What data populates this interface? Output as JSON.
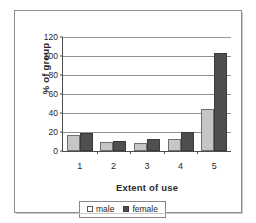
{
  "chart_data": {
    "type": "bar",
    "title": "",
    "subtitle": "",
    "xlabel": "Extent of use",
    "ylabel": "% of group",
    "categories": [
      "1",
      "2",
      "3",
      "4",
      "5"
    ],
    "series": [
      {
        "name": "male",
        "values": [
          17,
          9,
          8,
          13,
          44
        ],
        "color": "#c6c6c6"
      },
      {
        "name": "female",
        "values": [
          19,
          11,
          13,
          20,
          103
        ],
        "color": "#4f4f4f"
      }
    ],
    "ylim": [
      0,
      120
    ],
    "ytick_labels": [
      "0",
      "20",
      "40",
      "60",
      "80",
      "100",
      "120"
    ],
    "ytick_values": [
      0,
      20,
      40,
      60,
      80,
      100,
      120
    ],
    "grid": "horizontal",
    "legend_position": "bottom",
    "legend_entries": [
      "male",
      "female"
    ]
  },
  "legend": {
    "male_label": "male",
    "female_label": "female"
  },
  "axes": {
    "y_title": "% of group",
    "x_title": "Extent of use"
  }
}
